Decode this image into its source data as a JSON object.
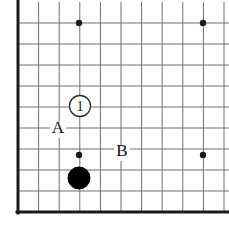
{
  "figure": {
    "kind": "go-board-diagram",
    "caption": "",
    "background_color": "#ffffff",
    "line_color": "#6f6f6f",
    "edge_color": "#1a1a1a",
    "stone_black_color": "#000000",
    "stone_white_color": "#ffffff"
  },
  "board": {
    "columns": 11,
    "rows": 10,
    "x_start": 18,
    "y_start": 23,
    "x_step": 20.6,
    "y_step": 21.0,
    "thick_edges": [
      "left",
      "bottom"
    ],
    "thin_line_width": 1,
    "thick_line_width": 3
  },
  "star_points": [
    {
      "name": "star-top-left",
      "x": 79,
      "y": 23,
      "radius": 3.2
    },
    {
      "name": "star-top-right",
      "x": 203,
      "y": 23,
      "radius": 3.2
    },
    {
      "name": "star-bottom-left",
      "x": 79,
      "y": 155,
      "radius": 3.2
    },
    {
      "name": "star-bottom-right",
      "x": 203,
      "y": 155,
      "radius": 3.2
    }
  ],
  "stones": [
    {
      "name": "black-stone",
      "color": "black",
      "x": 79,
      "y": 178,
      "radius": 11,
      "label": ""
    },
    {
      "name": "white-stone-move-1",
      "color": "white",
      "x": 80,
      "y": 106,
      "radius": 10.5,
      "label": "1"
    }
  ],
  "point_labels": [
    {
      "name": "point-label-a",
      "text": "A",
      "x": 58,
      "y": 133,
      "font_size": 17
    },
    {
      "name": "point-label-b",
      "text": "B",
      "x": 122,
      "y": 156,
      "font_size": 17
    }
  ]
}
